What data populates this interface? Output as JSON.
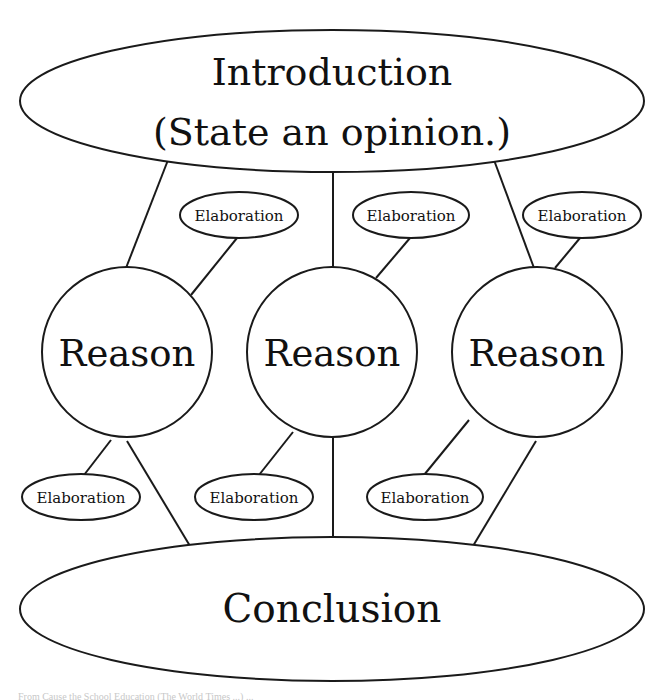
{
  "diagram": {
    "type": "essay-structure",
    "introduction": {
      "line1": "Introduction",
      "line2": "(State an opinion.)"
    },
    "reasons": [
      {
        "label": "Reason",
        "elaboration_top": "Elaboration",
        "elaboration_bottom": "Elaboration"
      },
      {
        "label": "Reason",
        "elaboration_top": "Elaboration",
        "elaboration_bottom": "Elaboration"
      },
      {
        "label": "Reason",
        "elaboration_top": "Elaboration",
        "elaboration_bottom": "Elaboration"
      }
    ],
    "conclusion": {
      "label": "Conclusion"
    },
    "colors": {
      "stroke": "#1a1a1a",
      "fill": "#ffffff",
      "text": "#111111"
    }
  },
  "footer": {
    "caption": "From Cause the School Education (The World Times ...) ..."
  }
}
